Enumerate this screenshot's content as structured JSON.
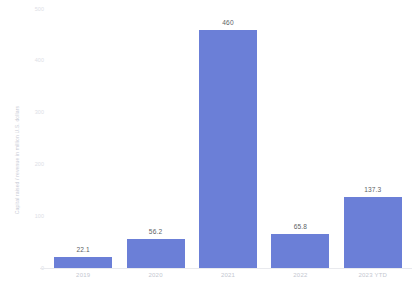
{
  "chart_data": {
    "type": "bar",
    "title": "",
    "subtitle": "",
    "xlabel": "",
    "ylabel": "Capital raised / revenue in million U.S. dollars",
    "categories": [
      "2019",
      "2020",
      "2021",
      "2022",
      "2023 YTD"
    ],
    "values": [
      22.1,
      460,
      56.2,
      65.8,
      137.3
    ],
    "series": [
      {
        "name": "",
        "values": [
          22.1,
          56.2,
          460,
          65.8,
          137.3
        ]
      }
    ],
    "value_labels": [
      "22.1",
      "56.2",
      "460",
      "65.8",
      "137.3"
    ],
    "ylim": [
      0,
      500
    ],
    "yticks": [
      0,
      100,
      200,
      300,
      400,
      500
    ],
    "ytick_labels": [
      "0",
      "100",
      "200",
      "300",
      "400",
      "500"
    ],
    "grid": false,
    "legend": "none",
    "bar_color": "#6b7fd7",
    "value_label_color": "#5c5f66",
    "tick_label_color": "#c4c7d0",
    "axis_line_color": "#e9eaee",
    "background_color": "#ffffff"
  }
}
